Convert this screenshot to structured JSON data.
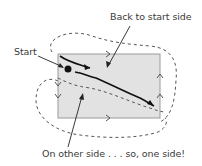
{
  "diagram": {
    "labels": {
      "top": "Back to start side",
      "start": "Start",
      "bottom": "On other side . . . so, one side!"
    },
    "colors": {
      "rectangle_fill": "#e2e2e2",
      "rectangle_stroke": "#9a9a9a",
      "ink": "#111111",
      "dashed": "#555555"
    },
    "elements": {
      "rectangle": "paper strip surface",
      "start_dot": "starting point",
      "solid_path": "path on start side",
      "dashed_path": "path on other side",
      "direction_arrows": [
        "top-right",
        "left-down-1",
        "left-down-2",
        "right-up-1",
        "right-up-2",
        "bottom-right"
      ]
    }
  }
}
